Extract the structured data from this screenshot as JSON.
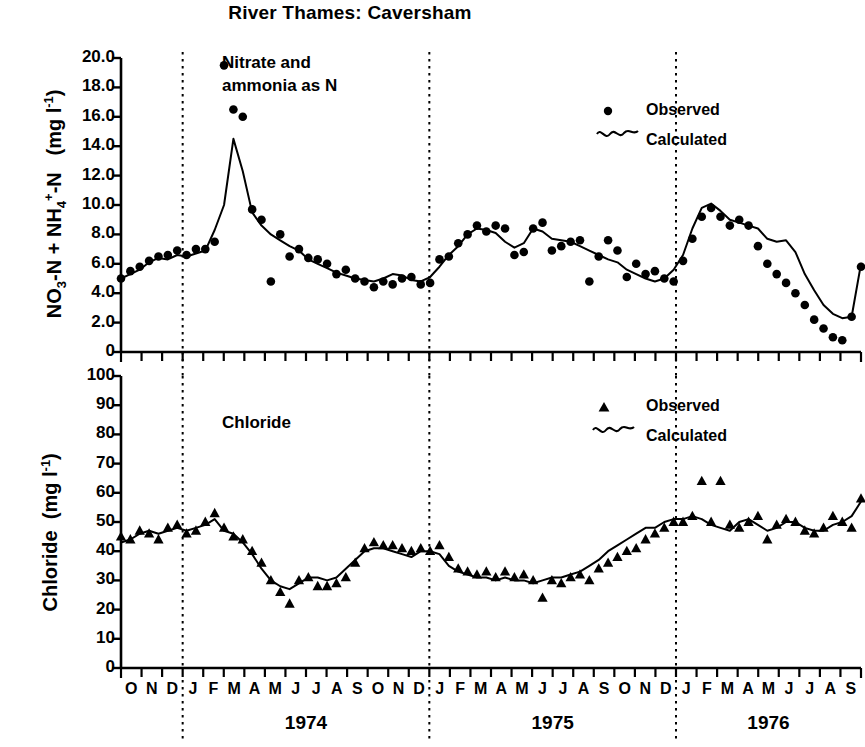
{
  "header": {
    "title": "River Thames:  Caversham"
  },
  "panels": [
    {
      "id": "nitrate",
      "annotation": "Nitrate and\nammonia as N",
      "axis_title": "NO3-N + NH4+-N   (mg l-1)",
      "axis_title_parts": {
        "pre": "NO",
        "sub1": "3",
        "mid": "-N + NH",
        "sub2": "4",
        "sup2": "+",
        "post": "-N",
        "unit_pre": "(mg l",
        "unit_sup": "-1",
        "unit_post": ")"
      },
      "yticks": [
        "0",
        "2.0",
        "4.0",
        "6.0",
        "8.0",
        "10.0",
        "12.0",
        "14.0",
        "16.0",
        "18.0",
        "20.0"
      ],
      "legend": [
        {
          "marker": "circle-marker",
          "label": "Observed"
        },
        {
          "marker": "wavy-line-marker",
          "label": "Calculated"
        }
      ]
    },
    {
      "id": "chloride",
      "annotation": "Chloride",
      "axis_title": "Chloride  (mg l-1)",
      "axis_title_parts": {
        "pre": "Chloride",
        "unit_pre": "(mg l",
        "unit_sup": "-1",
        "unit_post": ")"
      },
      "yticks": [
        "0",
        "10",
        "20",
        "30",
        "40",
        "50",
        "60",
        "70",
        "80",
        "90",
        "100"
      ],
      "legend": [
        {
          "marker": "triangle-marker",
          "label": "Observed"
        },
        {
          "marker": "wavy-line-marker",
          "label": "Calculated"
        }
      ]
    }
  ],
  "xaxis": {
    "months": [
      "O",
      "N",
      "D",
      "J",
      "F",
      "M",
      "A",
      "M",
      "J",
      "J",
      "A",
      "S",
      "O",
      "N",
      "D",
      "J",
      "F",
      "M",
      "A",
      "M",
      "J",
      "J",
      "A",
      "S",
      "O",
      "N",
      "D",
      "J",
      "F",
      "M",
      "A",
      "M",
      "J",
      "J",
      "A",
      "S"
    ],
    "years": [
      {
        "label": "1974",
        "start_index": 3,
        "end_index": 14
      },
      {
        "label": "1975",
        "start_index": 15,
        "end_index": 26
      },
      {
        "label": "1976",
        "start_index": 27,
        "end_index": 35
      }
    ],
    "year_boundaries": [
      3,
      15,
      27
    ]
  },
  "colors": {
    "ink": "#000000",
    "background": "#ffffff"
  },
  "chart_data": [
    {
      "type": "line",
      "id": "nitrate-panel",
      "title": "River Thames:  Caversham",
      "subtitle": "Nitrate and ammonia as N",
      "xlabel": "",
      "ylabel": "NO3-N + NH4+-N  (mg l-1)",
      "ylim": [
        0,
        20
      ],
      "ytick_step": 2,
      "grid": false,
      "legend_position": "top-right",
      "xlim_months": [
        "1973-10",
        "1976-09"
      ],
      "series": [
        {
          "name": "Observed",
          "marker": "circle",
          "style": "points",
          "x": [
            "1973-10",
            "1973-10.4",
            "1973-10.8",
            "1973-11.1",
            "1973-11.5",
            "1973-11.9",
            "1973-12.2",
            "1973-12.6",
            "1973-12.9",
            "1974-01.2",
            "1974-01.5",
            "1974-01.8",
            "1974-02.0",
            "1974-02.2",
            "1974-02.5",
            "1974-02.9",
            "1974-03.2",
            "1974-03.6",
            "1974-04.0",
            "1974-04.4",
            "1974-04.8",
            "1974-05.2",
            "1974-05.6",
            "1974-06.0",
            "1974-06.4",
            "1974-06.8",
            "1974-07.2",
            "1974-07.6",
            "1974-08.0",
            "1974-08.4",
            "1974-08.8",
            "1974-09.2",
            "1974-09.6",
            "1974-10.0",
            "1974-10.5",
            "1974-11.0",
            "1974-11.5",
            "1974-12.0",
            "1974-12.5",
            "1975-01.0",
            "1975-01.5",
            "1975-02.0",
            "1975-02.5",
            "1975-03.0",
            "1975-03.5",
            "1975-04.0",
            "1975-04.5",
            "1975-05.0",
            "1975-05.5",
            "1975-06.0",
            "1975-06.5",
            "1975-07.0",
            "1975-07.5",
            "1975-08.0",
            "1975-08.5",
            "1975-09.0",
            "1975-09.5",
            "1975-10.0",
            "1975-10.5",
            "1975-11.0",
            "1975-11.5",
            "1975-12.0",
            "1975-12.5",
            "1976-01.0",
            "1976-01.5",
            "1976-02.0",
            "1976-02.5",
            "1976-03.0",
            "1976-03.5",
            "1976-04.0",
            "1976-04.5",
            "1976-05.0",
            "1976-05.5",
            "1976-06.0",
            "1976-06.5",
            "1976-07.0",
            "1976-07.5",
            "1976-08.0",
            "1976-08.5",
            "1976-09.0"
          ],
          "values": [
            5.0,
            5.5,
            5.8,
            6.2,
            6.5,
            6.6,
            6.9,
            6.6,
            7.0,
            7.0,
            7.5,
            19.5,
            16.5,
            16.0,
            9.7,
            9.0,
            4.8,
            8.0,
            6.5,
            7.0,
            6.4,
            6.3,
            6.0,
            5.3,
            5.6,
            5.0,
            4.8,
            4.4,
            4.8,
            4.6,
            5.0,
            5.1,
            4.6,
            4.7,
            6.3,
            6.5,
            7.4,
            8.0,
            8.6,
            8.2,
            8.6,
            8.4,
            6.6,
            6.8,
            8.4,
            8.8,
            6.9,
            7.2,
            7.5,
            7.6,
            4.8,
            6.5,
            7.6,
            6.9,
            5.1,
            6.0,
            5.3,
            5.5,
            5.0,
            4.8,
            6.2,
            7.7,
            9.2,
            9.8,
            9.2,
            8.6,
            9.0,
            8.6,
            7.2,
            6.0,
            5.3,
            4.7,
            4.0,
            3.2,
            2.2,
            1.6,
            1.0,
            0.8,
            2.4,
            5.8
          ]
        },
        {
          "name": "Calculated",
          "style": "line",
          "values": [
            5.0,
            5.3,
            5.6,
            6.1,
            6.4,
            6.3,
            6.6,
            6.5,
            6.7,
            6.9,
            8.3,
            10.0,
            14.5,
            12.3,
            9.5,
            8.6,
            8.0,
            7.6,
            7.2,
            6.9,
            6.3,
            6.0,
            5.7,
            5.4,
            5.2,
            5.0,
            4.9,
            4.8,
            5.0,
            5.3,
            5.2,
            4.9,
            4.8,
            5.1,
            5.8,
            6.6,
            7.2,
            8.0,
            8.4,
            8.3,
            8.1,
            7.5,
            7.1,
            7.4,
            8.4,
            8.2,
            7.7,
            7.6,
            7.5,
            7.2,
            6.9,
            6.6,
            6.3,
            6.1,
            5.6,
            5.3,
            5.0,
            4.8,
            5.0,
            5.6,
            6.6,
            8.4,
            9.8,
            10.1,
            9.6,
            9.0,
            8.8,
            8.6,
            8.4,
            7.7,
            7.5,
            7.6,
            6.8,
            5.3,
            4.2,
            3.2,
            2.6,
            2.3,
            2.4,
            6.0
          ]
        }
      ]
    },
    {
      "type": "line",
      "id": "chloride-panel",
      "subtitle": "Chloride",
      "xlabel": "",
      "ylabel": "Chloride  (mg l-1)",
      "ylim": [
        0,
        100
      ],
      "ytick_step": 10,
      "grid": false,
      "legend_position": "top-right",
      "xlim_months": [
        "1973-10",
        "1976-09"
      ],
      "series": [
        {
          "name": "Observed",
          "marker": "triangle",
          "style": "points",
          "values": [
            45,
            44,
            47,
            46,
            44,
            48,
            49,
            46,
            47,
            50,
            53,
            48,
            45,
            44,
            40,
            36,
            30,
            26,
            22,
            30,
            31,
            28,
            28,
            29,
            31,
            36,
            41,
            43,
            42,
            42,
            41,
            40,
            41,
            40,
            42,
            38,
            34,
            33,
            32,
            33,
            31,
            33,
            31,
            32,
            30,
            24,
            30,
            29,
            31,
            32,
            30,
            34,
            36,
            38,
            40,
            41,
            44,
            46,
            48,
            50,
            50,
            52,
            64,
            50,
            64,
            49,
            48,
            50,
            52,
            44,
            49,
            51,
            50,
            47,
            46,
            48,
            52,
            50,
            48,
            58
          ]
        },
        {
          "name": "Calculated",
          "style": "line",
          "values": [
            43,
            44,
            46,
            47,
            46,
            47,
            48,
            47,
            48,
            49,
            51,
            47,
            46,
            43,
            39,
            34,
            30,
            28,
            27,
            29,
            31,
            31,
            30,
            31,
            34,
            37,
            40,
            41,
            41,
            40,
            39,
            38,
            40,
            40,
            39,
            35,
            33,
            32,
            31,
            31,
            30,
            31,
            30,
            30,
            29,
            30,
            31,
            31,
            32,
            33,
            35,
            37,
            40,
            42,
            44,
            46,
            48,
            48,
            50,
            51,
            51,
            52,
            51,
            49,
            48,
            47,
            50,
            51,
            49,
            47,
            48,
            50,
            50,
            48,
            47,
            47,
            49,
            50,
            52,
            57
          ]
        }
      ]
    }
  ]
}
